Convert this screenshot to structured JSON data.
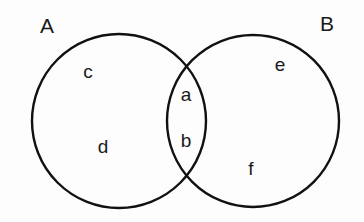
{
  "diagram": {
    "type": "venn-2-set",
    "title_a": "A",
    "title_b": "B",
    "background_color": "#fdfdfd",
    "stroke_color": "#111111",
    "label_color": "#1a1a1a",
    "sets": [
      {
        "name": "A",
        "label": "A",
        "label_x": 47,
        "label_y": 27,
        "cx": 119,
        "cy": 121,
        "r": 87
      },
      {
        "name": "B",
        "label": "B",
        "label_x": 327,
        "label_y": 25,
        "cx": 253,
        "cy": 121,
        "r": 86
      }
    ],
    "regions": [
      {
        "id": "c",
        "label": "c",
        "region": "a-only",
        "x": 88,
        "y": 73
      },
      {
        "id": "d",
        "label": "d",
        "region": "a-only",
        "x": 103,
        "y": 148
      },
      {
        "id": "a",
        "label": "a",
        "region": "intersection",
        "x": 186,
        "y": 96
      },
      {
        "id": "b",
        "label": "b",
        "region": "intersection",
        "x": 186,
        "y": 142
      },
      {
        "id": "e",
        "label": "e",
        "region": "b-only",
        "x": 280,
        "y": 66
      },
      {
        "id": "f",
        "label": "f",
        "region": "b-only",
        "x": 251,
        "y": 170
      }
    ]
  }
}
